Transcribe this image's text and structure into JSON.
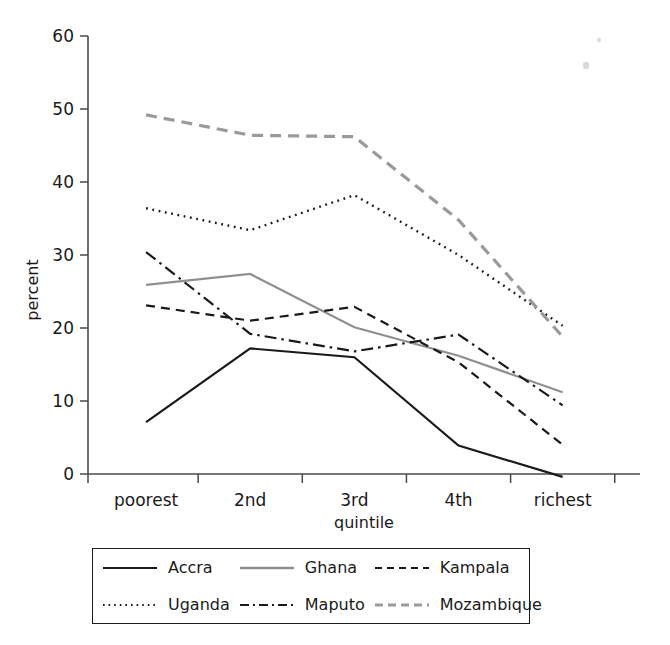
{
  "chart_data": {
    "type": "line",
    "title": "",
    "xlabel": "quintile",
    "ylabel": "percent",
    "categories": [
      "poorest",
      "2nd",
      "3rd",
      "4th",
      "richest"
    ],
    "ylim": [
      0,
      60
    ],
    "yticks": [
      0,
      10,
      20,
      30,
      40,
      50,
      60
    ],
    "grid": false,
    "legend_position": "bottom",
    "series": [
      {
        "name": "Accra",
        "values": [
          7.1,
          17.2,
          16.0,
          3.9,
          -0.4
        ],
        "color": "#1a1a1a",
        "style": "solid"
      },
      {
        "name": "Ghana",
        "values": [
          25.9,
          27.4,
          20.1,
          16.2,
          11.2
        ],
        "color": "#8f8f8f",
        "style": "solid"
      },
      {
        "name": "Kampala",
        "values": [
          23.1,
          21.0,
          22.9,
          15.3,
          4.0
        ],
        "color": "#1a1a1a",
        "style": "dashed"
      },
      {
        "name": "Uganda",
        "values": [
          36.4,
          33.4,
          38.2,
          30.0,
          20.3
        ],
        "color": "#1a1a1a",
        "style": "dotted"
      },
      {
        "name": "Maputo",
        "values": [
          30.4,
          19.2,
          16.8,
          19.1,
          9.4
        ],
        "color": "#1a1a1a",
        "style": "dashdot"
      },
      {
        "name": "Mozambique",
        "values": [
          49.2,
          46.4,
          46.2,
          34.8,
          18.8
        ],
        "color": "#9a9a9a",
        "style": "dashed-thick"
      }
    ]
  },
  "legend": {
    "entries": [
      {
        "label": "Accra",
        "sample": "solid-black-line-icon"
      },
      {
        "label": "Ghana",
        "sample": "solid-gray-line-icon"
      },
      {
        "label": "Kampala",
        "sample": "dashed-black-line-icon"
      },
      {
        "label": "Uganda",
        "sample": "dotted-black-line-icon"
      },
      {
        "label": "Maputo",
        "sample": "dashdot-black-line-icon"
      },
      {
        "label": "Mozambique",
        "sample": "dashed-gray-line-icon"
      }
    ]
  },
  "axes": {
    "y_tick_labels": [
      "60",
      "50",
      "40",
      "30",
      "20",
      "10",
      "0"
    ],
    "x_tick_labels": [
      "poorest",
      "2nd",
      "3rd",
      "4th",
      "richest"
    ],
    "y_axis_title": "percent",
    "x_axis_title": "quintile"
  }
}
